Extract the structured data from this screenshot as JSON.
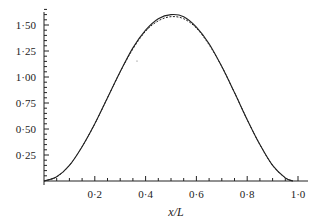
{
  "chart_data": {
    "type": "line",
    "title": "",
    "xlabel": "x/L",
    "ylabel": "",
    "xlim": [
      0,
      1.05
    ],
    "ylim": [
      0,
      1.65
    ],
    "grid": false,
    "legend": null,
    "x_ticks": [
      {
        "value": 0.2,
        "label": "0·2"
      },
      {
        "value": 0.4,
        "label": "0·4"
      },
      {
        "value": 0.6,
        "label": "0·6"
      },
      {
        "value": 0.8,
        "label": "0·8"
      },
      {
        "value": 1.0,
        "label": "1·0"
      }
    ],
    "y_ticks": [
      {
        "value": 0.25,
        "label": "0·25"
      },
      {
        "value": 0.5,
        "label": "0·50"
      },
      {
        "value": 0.75,
        "label": "0·75"
      },
      {
        "value": 1.0,
        "label": "1·00"
      },
      {
        "value": 1.25,
        "label": "1·25"
      },
      {
        "value": 1.5,
        "label": "1·50"
      }
    ],
    "x_minor_step": 0.05,
    "y_minor_step": 0.05,
    "x": [
      0.0,
      0.05,
      0.1,
      0.15,
      0.2,
      0.25,
      0.3,
      0.35,
      0.4,
      0.45,
      0.5,
      0.55,
      0.6,
      0.65,
      0.7,
      0.75,
      0.8,
      0.85,
      0.9,
      0.95,
      0.98
    ],
    "series": [
      {
        "name": "solid",
        "style": "solid",
        "color": "#222222",
        "values": [
          0.0,
          0.04,
          0.15,
          0.33,
          0.55,
          0.8,
          1.05,
          1.28,
          1.45,
          1.56,
          1.6,
          1.58,
          1.48,
          1.32,
          1.1,
          0.85,
          0.59,
          0.35,
          0.15,
          0.03,
          0.0
        ]
      },
      {
        "name": "dashed",
        "style": "dashed",
        "color": "#222222",
        "values": [
          0.0,
          0.04,
          0.15,
          0.33,
          0.55,
          0.8,
          1.05,
          1.27,
          1.44,
          1.54,
          1.58,
          1.56,
          1.47,
          1.31,
          1.1,
          0.85,
          0.59,
          0.35,
          0.15,
          0.03,
          0.0
        ]
      }
    ]
  }
}
